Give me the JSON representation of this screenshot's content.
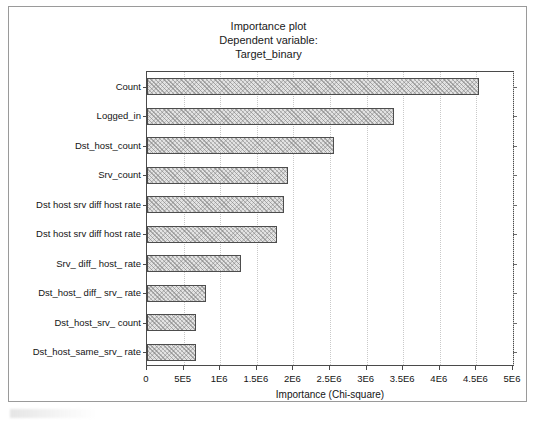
{
  "title": {
    "line1": "Importance plot",
    "line2": "Dependent variable:",
    "line3": "Target_binary"
  },
  "axis": {
    "xlabel": "Importance (Chi-square)",
    "xtick_labels": [
      "0",
      "5E5",
      "1E6",
      "1.5E6",
      "2E6",
      "2.5E6",
      "3E6",
      "3.5E6",
      "4E6",
      "4.5E6",
      "5E6"
    ]
  },
  "style": {
    "bar_fill": "#e3e3e3",
    "bar_border": "#4d4d4d",
    "frame": "#4a4a4a",
    "gridline": "#c9c9c9",
    "page_border": "#9a9a9a",
    "text": "#141414"
  },
  "chart_data": {
    "type": "bar",
    "orientation": "horizontal",
    "title": "Importance plot\nDependent variable:\nTarget_binary",
    "xlabel": "Importance (Chi-square)",
    "ylabel": "",
    "xlim": [
      0,
      5000000
    ],
    "xticks": [
      0,
      500000,
      1000000,
      1500000,
      2000000,
      2500000,
      3000000,
      3500000,
      4000000,
      4500000,
      5000000
    ],
    "xtick_labels": [
      "0",
      "5E5",
      "1E6",
      "1.5E6",
      "2E6",
      "2.5E6",
      "3E6",
      "3.5E6",
      "4E6",
      "4.5E6",
      "5E6"
    ],
    "grid": "vertical-dotted",
    "legend": "none",
    "categories": [
      "Count",
      "Logged_in",
      "Dst_host_count",
      "Srv_count",
      "Dst host srv diff host rate",
      "Dst host srv diff host rate",
      "Srv_ diff_ host_ rate",
      "Dst_host_ diff_ srv_ rate",
      "Dst_host_srv_ count",
      "Dst_host_same_srv_ rate"
    ],
    "values": [
      4540000,
      3370000,
      2550000,
      1930000,
      1870000,
      1770000,
      1290000,
      800000,
      670000,
      670000
    ]
  }
}
